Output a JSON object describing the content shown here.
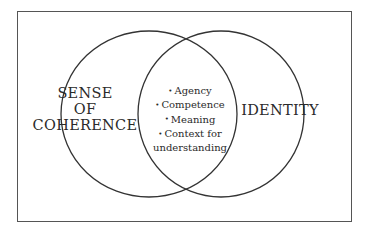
{
  "diagram": {
    "type": "venn",
    "left_set": {
      "label_lines": [
        "SENSE",
        "OF",
        "COHERENCE"
      ]
    },
    "right_set": {
      "label": "IDENTITY"
    },
    "intersection": {
      "items": [
        "Agency",
        "Competence",
        "Meaning",
        "Context for",
        "understanding"
      ],
      "bullet_flags": [
        true,
        true,
        true,
        true,
        false
      ]
    },
    "colors": {
      "stroke": "#333333",
      "frame": "#555555",
      "text": "#2a2a2a",
      "background": "#ffffff"
    }
  }
}
